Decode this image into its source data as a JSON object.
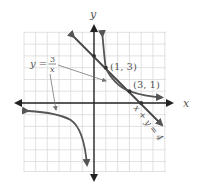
{
  "figure": {
    "axis_labels": {
      "x": "x",
      "y": "y"
    },
    "grid": {
      "x_min": -6,
      "x_max": 6,
      "y_min": -6,
      "y_max": 6,
      "step": 1
    },
    "curve": {
      "equation_lhs": "y =",
      "numerator": "3",
      "denominator": "x",
      "description": "hyperbola y = 3/x"
    },
    "line": {
      "equation": "x + y = 4"
    },
    "points": [
      {
        "label": "(1, 3)",
        "x": 1,
        "y": 3
      },
      {
        "label": "(3, 1)",
        "x": 3,
        "y": 1
      }
    ],
    "intercepts": [
      {
        "x": 0,
        "y": 4
      },
      {
        "x": 4,
        "y": 0
      }
    ],
    "colors": {
      "axis": "#222222",
      "grid": "#d9d9d9",
      "curve": "#555555",
      "line": "#444444",
      "label": "#555555"
    }
  }
}
